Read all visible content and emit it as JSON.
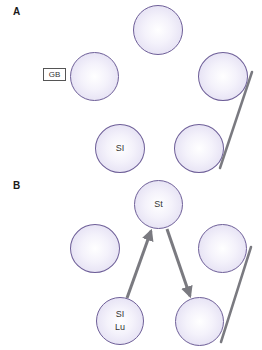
{
  "panels": [
    {
      "label": "A",
      "label_pos": {
        "x": 13,
        "y": 7
      },
      "nodes": [
        {
          "id": "a-top",
          "text": "",
          "cx": 158,
          "cy": 30
        },
        {
          "id": "a-gb",
          "text": "",
          "cx": 94,
          "cy": 76
        },
        {
          "id": "a-right",
          "text": "",
          "cx": 223,
          "cy": 76
        },
        {
          "id": "a-si",
          "text": "SI",
          "cx": 120,
          "cy": 148
        },
        {
          "id": "a-bottom-right",
          "text": "",
          "cx": 199,
          "cy": 148
        }
      ],
      "tag": {
        "text": "GB"
      },
      "lines": [
        {
          "x1": 252,
          "y1": 72,
          "x2": 220,
          "y2": 168
        }
      ]
    },
    {
      "label": "B",
      "label_pos": {
        "x": 13,
        "y": 181
      },
      "nodes": [
        {
          "id": "b-st",
          "text": "St",
          "cx": 158,
          "cy": 204
        },
        {
          "id": "b-left",
          "text": "",
          "cx": 95,
          "cy": 248
        },
        {
          "id": "b-right",
          "text": "",
          "cx": 223,
          "cy": 248
        },
        {
          "id": "b-si-lu",
          "text_line1": "SI",
          "text_line2": "Lu",
          "cx": 120,
          "cy": 320
        },
        {
          "id": "b-bottom-right",
          "text": "",
          "cx": 199,
          "cy": 321
        }
      ],
      "arrows": [
        {
          "from": "b-si-lu",
          "to": "b-st",
          "x1": 127,
          "y1": 298,
          "x2": 152,
          "y2": 229
        },
        {
          "from": "b-st",
          "to": "b-bottom-right",
          "x1": 167,
          "y1": 229,
          "x2": 191,
          "y2": 298
        }
      ],
      "lines": [
        {
          "x1": 251,
          "y1": 247,
          "x2": 221,
          "y2": 342
        }
      ]
    }
  ],
  "colors": {
    "node_stroke": "#6e5f98",
    "node_fill_center": "#ffffff",
    "node_fill_edge": "#dcd7ef",
    "connector": "#7a7a80",
    "text": "#333333"
  }
}
